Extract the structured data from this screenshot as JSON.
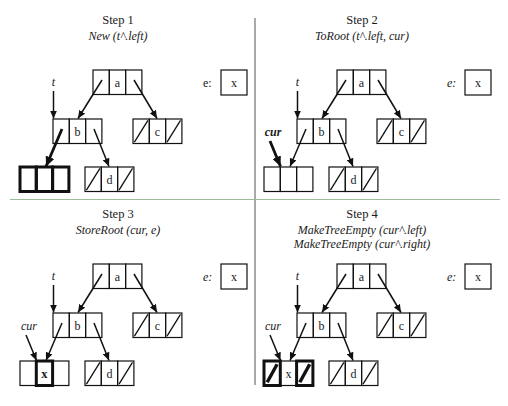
{
  "tree": {
    "root": {
      "info": "a",
      "left": "pointer",
      "right": "pointer"
    },
    "root_left": {
      "info": "b",
      "left": "pointer",
      "right": "pointer"
    },
    "root_right": {
      "info": "c",
      "left": "nil",
      "right": "nil"
    },
    "b_right": {
      "info": "d",
      "left": "nil",
      "right": "nil"
    }
  },
  "steps": [
    {
      "title": "Step 1",
      "subtitle": [
        "New (t^.left)"
      ],
      "t_label": "t",
      "cur_label": null,
      "e_label": "e:",
      "e_value": "x",
      "new_node": {
        "info": "",
        "left": "unset",
        "right": "unset"
      },
      "highlight": [
        "new-node",
        "b-left-pointer"
      ]
    },
    {
      "title": "Step 2",
      "subtitle": [
        "ToRoot (t^.left, cur)"
      ],
      "t_label": "t",
      "cur_label": "cur",
      "e_label": "e:",
      "e_value": "x",
      "new_node": {
        "info": "",
        "left": "unset",
        "right": "unset"
      },
      "highlight": [
        "cur-pointer"
      ]
    },
    {
      "title": "Step 3",
      "subtitle": [
        "StoreRoot (cur, e)"
      ],
      "t_label": "t",
      "cur_label": "cur",
      "e_label": "e:",
      "e_value": "x",
      "new_node": {
        "info": "x",
        "left": "unset",
        "right": "unset"
      },
      "highlight": [
        "new-node-info"
      ]
    },
    {
      "title": "Step 4",
      "subtitle": [
        "MakeTreeEmpty (cur^.left)",
        "MakeTreeEmpty (cur^.right)"
      ],
      "t_label": "t",
      "cur_label": "cur",
      "e_label": "e:",
      "e_value": "x",
      "new_node": {
        "info": "x",
        "left": "nil",
        "right": "nil"
      },
      "highlight": [
        "new-node-left",
        "new-node-right"
      ]
    }
  ],
  "colors": {
    "ink": "#111111",
    "horizontal_divider": "#9cbc9c",
    "vertical_divider": "#555555"
  }
}
